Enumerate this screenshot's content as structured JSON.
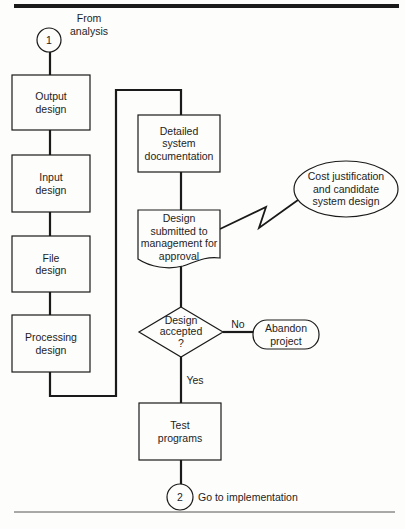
{
  "diagram": {
    "type": "flowchart",
    "start_connector": {
      "number": "1",
      "label": "From analysis",
      "label_lines": [
        "From",
        "analysis"
      ]
    },
    "end_connector": {
      "number": "2",
      "label": "Go to implementation"
    },
    "nodes": [
      {
        "id": "output-design",
        "shape": "process",
        "lines": [
          "Output",
          "design"
        ]
      },
      {
        "id": "input-design",
        "shape": "process",
        "lines": [
          "Input",
          "design"
        ]
      },
      {
        "id": "file-design",
        "shape": "process",
        "lines": [
          "File",
          "design"
        ]
      },
      {
        "id": "processing-design",
        "shape": "process",
        "lines": [
          "Processing",
          "design"
        ]
      },
      {
        "id": "detailed-system-documentation",
        "shape": "process",
        "lines": [
          "Detailed",
          "system",
          "documentation"
        ]
      },
      {
        "id": "design-submitted",
        "shape": "document",
        "lines": [
          "Design",
          "submitted to",
          "management for",
          "approval"
        ]
      },
      {
        "id": "cost-justification",
        "shape": "ellipse",
        "lines": [
          "Cost justification",
          "and candidate",
          "system design"
        ]
      },
      {
        "id": "design-accepted",
        "shape": "decision",
        "lines": [
          "Design",
          "accepted",
          "?"
        ]
      },
      {
        "id": "abandon-project",
        "shape": "terminal",
        "lines": [
          "Abandon",
          "project"
        ]
      },
      {
        "id": "test-programs",
        "shape": "process",
        "lines": [
          "Test",
          "programs"
        ]
      }
    ],
    "edges": [
      {
        "from": "connector-1",
        "to": "output-design"
      },
      {
        "from": "output-design",
        "to": "input-design"
      },
      {
        "from": "input-design",
        "to": "file-design"
      },
      {
        "from": "file-design",
        "to": "processing-design"
      },
      {
        "from": "processing-design",
        "to": "detailed-system-documentation"
      },
      {
        "from": "detailed-system-documentation",
        "to": "design-submitted"
      },
      {
        "from": "design-submitted",
        "to": "cost-justification",
        "style": "communication-link"
      },
      {
        "from": "design-submitted",
        "to": "design-accepted"
      },
      {
        "from": "design-accepted",
        "to": "abandon-project",
        "label": "No"
      },
      {
        "from": "design-accepted",
        "to": "test-programs",
        "label": "Yes"
      },
      {
        "from": "test-programs",
        "to": "connector-2"
      }
    ],
    "edge_labels": {
      "no": "No",
      "yes": "Yes"
    },
    "colors": {
      "line": "#1a1a1a",
      "background": "#fdfdfb"
    }
  }
}
